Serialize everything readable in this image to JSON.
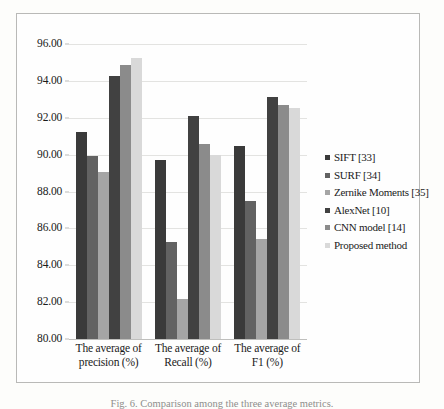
{
  "chart_data": {
    "type": "bar",
    "title": "",
    "xlabel": "",
    "ylabel": "",
    "ylim": [
      80.0,
      96.0
    ],
    "ytick_step": 2.0,
    "grid": true,
    "legend_position": "right",
    "categories": [
      "The average of precision (%)",
      "The average of Recall (%)",
      "The average of F1 (%)"
    ],
    "category_lines": [
      [
        "The average of",
        "precision (%)"
      ],
      [
        "The average of",
        "Recall (%)"
      ],
      [
        "The average of",
        "F1 (%)"
      ]
    ],
    "ytick_labels": [
      "96.00",
      "94.00",
      "92.00",
      "90.00",
      "88.00",
      "86.00",
      "84.00",
      "82.00",
      "80.00"
    ],
    "ytick_values": [
      96.0,
      94.0,
      92.0,
      90.0,
      88.0,
      86.0,
      84.0,
      82.0,
      80.0
    ],
    "series": [
      {
        "name": "SIFT [33]",
        "color": "#3a3a3a",
        "values": [
          91.25,
          89.7,
          90.45
        ]
      },
      {
        "name": "SURF [34]",
        "color": "#626262",
        "values": [
          89.95,
          85.25,
          87.5
        ]
      },
      {
        "name": "Zernike Moments [35]",
        "color": "#a5a5a5",
        "values": [
          89.05,
          82.15,
          85.45
        ]
      },
      {
        "name": "AlexNet [10]",
        "color": "#414141",
        "values": [
          94.25,
          92.1,
          93.15
        ]
      },
      {
        "name": "CNN model [14]",
        "color": "#8b8b8b",
        "values": [
          94.85,
          90.6,
          92.7
        ]
      },
      {
        "name": "Proposed method",
        "color": "#d9d9d9",
        "values": [
          95.25,
          90.0,
          92.55
        ]
      }
    ]
  },
  "caption": {
    "text": "Fig. 6. Comparison among the three average metrics."
  }
}
